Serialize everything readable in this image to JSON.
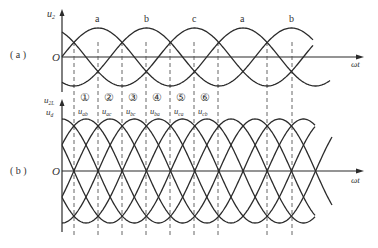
{
  "figure": {
    "panel_a": {
      "label": "( a )",
      "y_axis_label": "u",
      "y_axis_sub": "2",
      "origin_label": "O",
      "x_axis_label": "ωt",
      "phase_labels": [
        "a",
        "b",
        "c",
        "a",
        "b"
      ]
    },
    "panel_b": {
      "label": "( b )",
      "y_axis_label_top": "u",
      "y_axis_label_top_sub": "2L",
      "y_axis_label_bottom": "u",
      "y_axis_label_bottom_sub": "d",
      "origin_label": "O",
      "x_axis_label": "ωt",
      "segment_numbers": [
        "①",
        "②",
        "③",
        "④",
        "⑤",
        "⑥"
      ],
      "segment_labels": [
        {
          "base": "u",
          "sub": "ab"
        },
        {
          "base": "u",
          "sub": "ac"
        },
        {
          "base": "u",
          "sub": "bc"
        },
        {
          "base": "u",
          "sub": "ba"
        },
        {
          "base": "u",
          "sub": "ca"
        },
        {
          "base": "u",
          "sub": "cb"
        }
      ]
    },
    "colors": {
      "line": "#2b2b2b",
      "dash": "#555555",
      "text": "#333333"
    }
  }
}
